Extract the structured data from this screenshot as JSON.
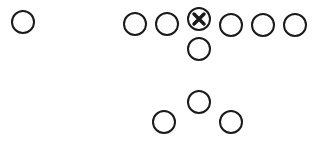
{
  "diagram": {
    "title": "",
    "stroke_color": "#1a1a1a",
    "nodes": [
      {
        "id": "lone-player",
        "marker": "circle"
      },
      {
        "id": "line-1",
        "marker": "circle"
      },
      {
        "id": "line-2",
        "marker": "circle"
      },
      {
        "id": "center",
        "marker": "circle-x"
      },
      {
        "id": "line-4",
        "marker": "circle"
      },
      {
        "id": "line-5",
        "marker": "circle"
      },
      {
        "id": "line-6",
        "marker": "circle"
      },
      {
        "id": "quarterback",
        "marker": "circle"
      },
      {
        "id": "back-top",
        "marker": "circle"
      },
      {
        "id": "back-left",
        "marker": "circle"
      },
      {
        "id": "back-right",
        "marker": "circle"
      }
    ]
  }
}
